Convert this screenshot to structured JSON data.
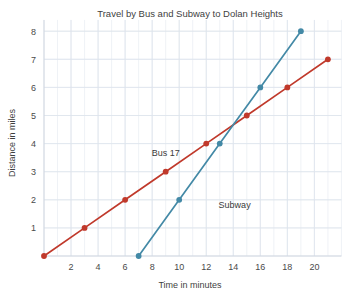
{
  "chart_data": {
    "type": "line",
    "title": "Travel by Bus and Subway to Dolan Heights",
    "xlabel": "Time in minutes",
    "ylabel": "Distance in miles",
    "xlim": [
      0,
      22
    ],
    "ylim": [
      0,
      8.4
    ],
    "grid": true,
    "legend_position": "inline-annotation",
    "xticks": [
      2,
      4,
      6,
      8,
      10,
      12,
      14,
      16,
      18,
      20
    ],
    "xtick_labels": [
      "2",
      "4",
      "6",
      "8",
      "10",
      "12",
      "14",
      "16",
      "18",
      "20"
    ],
    "yticks": [
      1,
      2,
      3,
      4,
      5,
      6,
      7,
      8
    ],
    "ytick_labels": [
      "1",
      "2",
      "3",
      "4",
      "5",
      "6",
      "7",
      "8"
    ],
    "series": [
      {
        "name": "Bus 17",
        "color": "#c0392b",
        "marker": "circle",
        "label_x": 9.0,
        "label_y": 3.55,
        "x": [
          0,
          3,
          6,
          9,
          12,
          15,
          18,
          21
        ],
        "y": [
          0,
          1,
          2,
          3,
          4,
          5,
          6,
          7
        ],
        "points": [
          [
            0,
            0
          ],
          [
            3,
            1
          ],
          [
            6,
            2
          ],
          [
            9,
            3
          ],
          [
            12,
            4
          ],
          [
            15,
            5
          ],
          [
            18,
            6
          ],
          [
            21,
            7
          ]
        ]
      },
      {
        "name": "Subway",
        "color": "#4389a6",
        "marker": "circle",
        "label_x": 14.1,
        "label_y": 1.72,
        "x": [
          7,
          10,
          13,
          16,
          19
        ],
        "y": [
          0,
          2,
          4,
          6,
          8
        ],
        "points": [
          [
            7,
            0
          ],
          [
            10,
            2
          ],
          [
            13,
            4
          ],
          [
            16,
            6
          ],
          [
            19,
            8
          ]
        ]
      }
    ]
  },
  "axes": {
    "title_text": "Travel by Bus and Subway to Dolan Heights",
    "x_axis_title": "Time in minutes",
    "y_axis_title": "Distance in miles"
  },
  "colors": {
    "bus_series": "#c0392b",
    "subway_series": "#4389a6",
    "grid": "#e8ecf2",
    "axis": "#cfd6e0",
    "text": "#3a3a3a",
    "background": "#ffffff"
  }
}
